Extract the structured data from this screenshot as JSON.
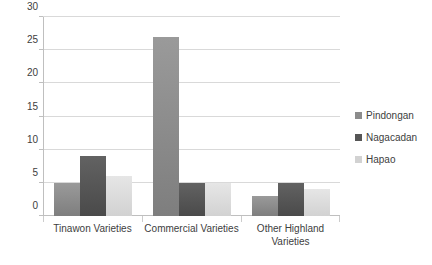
{
  "chart_data": {
    "type": "bar",
    "title": "",
    "subtitle": "",
    "xlabel": "",
    "ylabel": "",
    "categories": [
      "Tinawon Varieties",
      "Commercial Varieties",
      "Other Highland Varieties"
    ],
    "series": [
      {
        "name": "Pindongan",
        "color": "#8c8c8c",
        "values": [
          5,
          27,
          3
        ]
      },
      {
        "name": "Nagacadan",
        "color": "#565656",
        "values": [
          9,
          5,
          5
        ]
      },
      {
        "name": "Hapao",
        "color": "#d2d2d2",
        "values": [
          6,
          5,
          4
        ]
      }
    ],
    "ylim": [
      0,
      30
    ],
    "yticks": [
      0,
      5,
      10,
      15,
      20,
      25,
      30
    ],
    "ytick_labels": [
      "0",
      "5",
      "10",
      "15",
      "20",
      "25",
      "30"
    ],
    "grid": true,
    "grid_axis": "y",
    "legend_position": "right",
    "background_color": "#ffffff",
    "gridline_color": "#d9d9d9",
    "axis_color": "#bfbfbf",
    "text_color": "#404040"
  }
}
